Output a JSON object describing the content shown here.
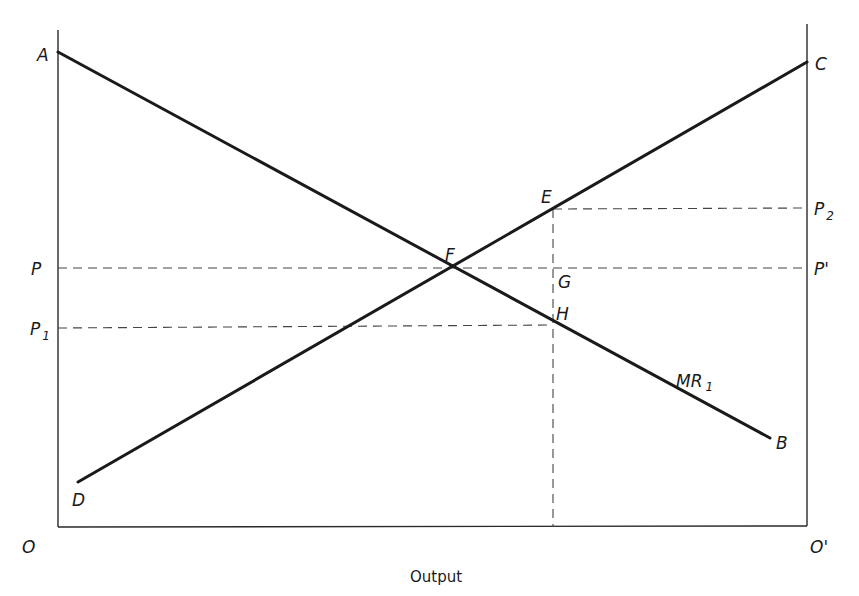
{
  "diagram": {
    "type": "economics-two-sided-output-diagram",
    "x_axis_title": "Output",
    "origin_left": "O",
    "origin_right": "O'",
    "points": {
      "A": "A",
      "B": "B",
      "C": "C",
      "D": "D",
      "E": "E",
      "F": "F",
      "G": "G",
      "H": "H"
    },
    "price_labels_left": {
      "P": "P",
      "P1_main": "P",
      "P1_sub": "1"
    },
    "price_labels_right": {
      "P2_main": "P",
      "P2_sub": "2",
      "P_prime": "P'"
    },
    "curve_labels": {
      "MR1_main": "MR",
      "MR1_sub": "1"
    },
    "lines": [
      {
        "name": "AB",
        "from": "A",
        "to": "B",
        "style": "solid",
        "label": "MR1"
      },
      {
        "name": "DC",
        "from": "D",
        "to": "C",
        "style": "solid"
      },
      {
        "name": "P-P'",
        "style": "dashed",
        "level": "P",
        "through": "F"
      },
      {
        "name": "P1-H",
        "style": "dashed",
        "level": "P1",
        "through": "H"
      },
      {
        "name": "E-P2",
        "style": "dashed",
        "level": "P2",
        "through": "E"
      },
      {
        "name": "E-vertical",
        "style": "dashed",
        "through": [
          "E",
          "G",
          "H"
        ],
        "to": "Output axis"
      }
    ]
  }
}
